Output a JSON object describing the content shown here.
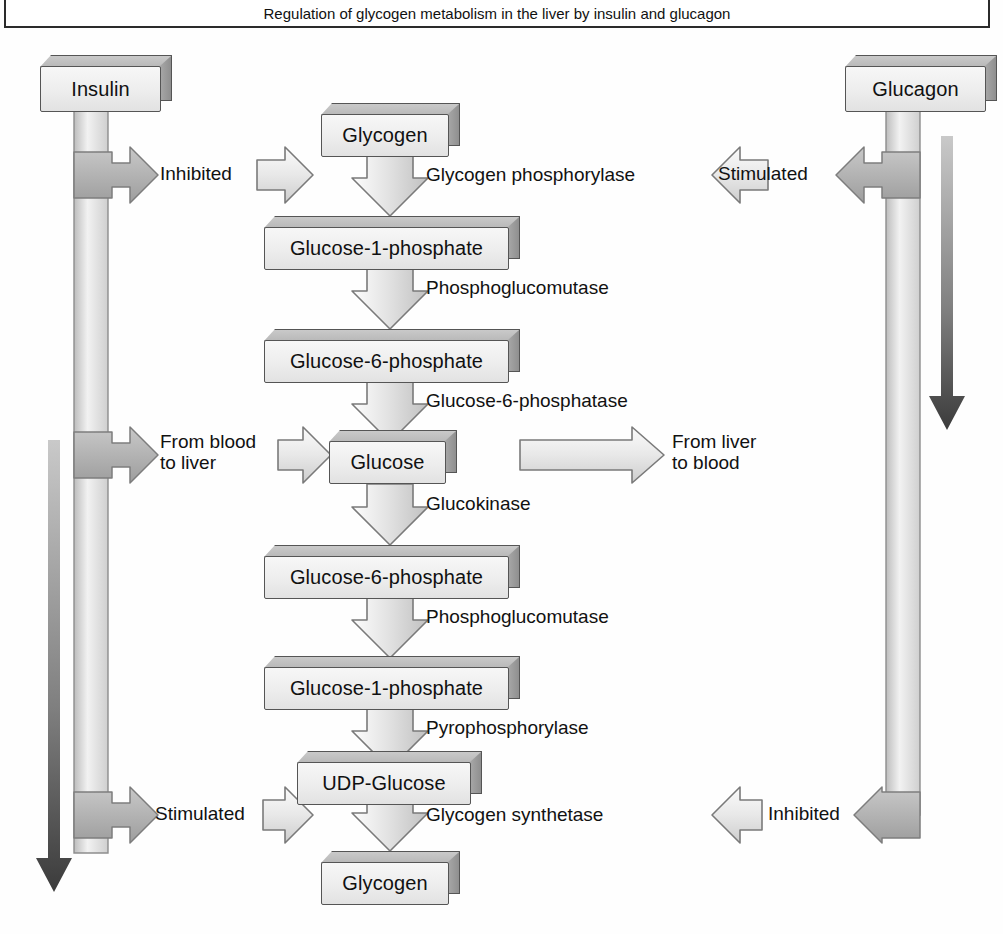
{
  "caption": {
    "text": "Regulation of glycogen metabolism in the liver by insulin and glucagon"
  },
  "hormones": [
    {
      "id": "insulin",
      "label": "Insulin"
    },
    {
      "id": "glucagon",
      "label": "Glucagon"
    }
  ],
  "pathway": {
    "metabolites": [
      {
        "id": "glycogen-top",
        "label": "Glycogen"
      },
      {
        "id": "g1p-top",
        "label": "Glucose-1-phosphate"
      },
      {
        "id": "g6p-top",
        "label": "Glucose-6-phosphate"
      },
      {
        "id": "glucose",
        "label": "Glucose"
      },
      {
        "id": "g6p-bottom",
        "label": "Glucose-6-phosphate"
      },
      {
        "id": "g1p-bottom",
        "label": "Glucose-1-phosphate"
      },
      {
        "id": "udp-glucose",
        "label": "UDP-Glucose"
      },
      {
        "id": "glycogen-bottom",
        "label": "Glycogen"
      }
    ],
    "enzymes": [
      {
        "id": "glycogen-phosphorylase",
        "label": "Glycogen phosphorylase"
      },
      {
        "id": "phosphoglucomutase-1",
        "label": "Phosphoglucomutase"
      },
      {
        "id": "glucose-6-phosphatase",
        "label": "Glucose-6-phosphatase"
      },
      {
        "id": "glucokinase",
        "label": "Glucokinase"
      },
      {
        "id": "phosphoglucomutase-2",
        "label": "Phosphoglucomutase"
      },
      {
        "id": "pyrophosphorylase",
        "label": "Pyrophosphorylase"
      },
      {
        "id": "glycogen-synthetase",
        "label": "Glycogen synthetase"
      }
    ]
  },
  "effects": {
    "insulin_inhibits_phosphorylase": "Inhibited",
    "glucagon_stimulates_phosphorylase": "Stimulated",
    "insulin_stimulates_synthetase": "Stimulated",
    "glucagon_inhibits_synthetase": "Inhibited"
  },
  "transport": {
    "uptake": "From blood\nto liver",
    "uptake_line1": "From blood",
    "uptake_line2": "to liver",
    "release_line1": "From liver",
    "release_line2": "to blood"
  },
  "colors": {
    "box_face_light": "#f7f7f7",
    "box_face_dark": "#e2e2e2",
    "box_outline": "#555555",
    "arrow_light": "#f2f2f2",
    "arrow_mid": "#cfcfcf",
    "arrow_outline": "#6b6b6b",
    "hormone_stem": "#b9b9b9",
    "dark_arrow": "#4a4a4a",
    "text": "#111111",
    "frame": "#2b2b2b"
  },
  "icons": {
    "down_block_arrow": "down-block-arrow-icon",
    "right_block_arrow": "right-block-arrow-icon",
    "left_block_arrow": "left-block-arrow-icon",
    "down_solid_arrow": "down-solid-arrow-icon"
  }
}
